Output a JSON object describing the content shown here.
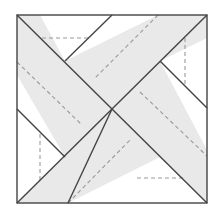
{
  "diagram": {
    "title": "",
    "colors": {
      "background": "#ffffff",
      "band_fill": "#e9e9e9",
      "triangle_fill": "#ffffff",
      "solid_stroke": "#444444",
      "dashed_stroke": "#9a9a9a"
    },
    "square": {
      "x1": 17,
      "y1": 15,
      "x2": 207,
      "y2": 203
    },
    "center": {
      "x": 112,
      "y": 109
    },
    "triangles": [
      {
        "name": "top",
        "points": "17,15 207,15 112,109"
      },
      {
        "name": "right",
        "points": "207,15 207,203 112,109"
      },
      {
        "name": "bottom",
        "points": "17,203 207,203 112,109"
      },
      {
        "name": "left",
        "points": "17,15 17,203 112,109"
      }
    ],
    "white_triangles": [
      {
        "name": "top",
        "points": "40,15 158,15 65,61"
      },
      {
        "name": "right",
        "points": "207,38 207,150 160,61"
      },
      {
        "name": "bottom",
        "points": "68,203 207,203 160,157"
      },
      {
        "name": "left",
        "points": "17,75 17,203 65,157"
      }
    ],
    "solid_lines": [
      {
        "name": "diagonal-tl-br",
        "x1": 17,
        "y1": 15,
        "x2": 207,
        "y2": 203
      },
      {
        "name": "diagonal-bl-tr",
        "x1": 17,
        "y1": 203,
        "x2": 207,
        "y2": 15
      },
      {
        "name": "top-tri-left-edge",
        "x1": 65,
        "y1": 61,
        "x2": 112,
        "y2": 15
      },
      {
        "name": "right-tri-lower-edge",
        "x1": 160,
        "y1": 61,
        "x2": 207,
        "y2": 108
      },
      {
        "name": "bottom-tri-left-edge",
        "x1": 112,
        "y1": 109,
        "x2": 68,
        "y2": 203
      },
      {
        "name": "left-tri-upper-edge",
        "x1": 17,
        "y1": 109,
        "x2": 65,
        "y2": 157
      }
    ],
    "dashed_lines": [
      {
        "name": "top-tri-base-dash",
        "x1": 42,
        "y1": 38,
        "x2": 88,
        "y2": 38
      },
      {
        "name": "right-tri-base-dash",
        "x1": 185,
        "y1": 38,
        "x2": 185,
        "y2": 84
      },
      {
        "name": "bottom-tri-base-dash",
        "x1": 137,
        "y1": 178,
        "x2": 183,
        "y2": 178
      },
      {
        "name": "left-tri-base-dash",
        "x1": 40,
        "y1": 134,
        "x2": 40,
        "y2": 180
      },
      {
        "name": "band-a-dash",
        "x1": 17,
        "y1": 62,
        "x2": 82,
        "y2": 125
      },
      {
        "name": "band-b-dash",
        "x1": 158,
        "y1": 15,
        "x2": 95,
        "y2": 78
      },
      {
        "name": "band-c-dash",
        "x1": 140,
        "y1": 92,
        "x2": 207,
        "y2": 156
      },
      {
        "name": "band-d-dash",
        "x1": 68,
        "y1": 203,
        "x2": 130,
        "y2": 140
      }
    ]
  }
}
